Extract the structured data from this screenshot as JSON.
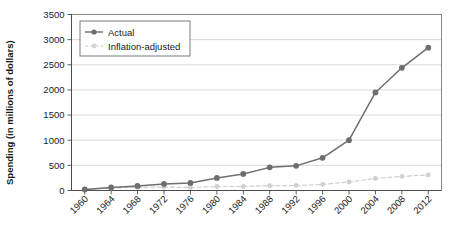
{
  "chart_data": {
    "type": "line",
    "title": "",
    "xlabel": "",
    "ylabel": "Spending (in millions of dollars)",
    "categories": [
      "1960",
      "1964",
      "1968",
      "1972",
      "1976",
      "1980",
      "1984",
      "1988",
      "1992",
      "1996",
      "2000",
      "2004",
      "2008",
      "2012"
    ],
    "x": [
      1960,
      1964,
      1968,
      1972,
      1976,
      1980,
      1984,
      1988,
      1992,
      1996,
      2000,
      2004,
      2008,
      2012
    ],
    "series": [
      {
        "name": "Actual",
        "color": "#6e6e6e",
        "style": "solid",
        "marker": "circle",
        "values": [
          20,
          60,
          90,
          130,
          150,
          250,
          330,
          460,
          490,
          650,
          1000,
          1950,
          2440,
          2840
        ]
      },
      {
        "name": "Inflation-adjusted",
        "color": "#cfcfcf",
        "style": "dashed",
        "marker": "circle",
        "values": [
          20,
          50,
          60,
          70,
          60,
          80,
          80,
          95,
          100,
          120,
          170,
          240,
          280,
          310
        ]
      }
    ],
    "ylim": [
      0,
      3500
    ],
    "yticks": [
      0,
      500,
      1000,
      1500,
      2000,
      2500,
      3000,
      3500
    ],
    "ytick_labels": [
      "0",
      "500",
      "1000",
      "1500",
      "2000",
      "2500",
      "3000",
      "3500"
    ],
    "grid": "horizontal",
    "legend_position": "top-left",
    "legend_entries": [
      "Actual",
      "Inflation-adjusted"
    ]
  }
}
